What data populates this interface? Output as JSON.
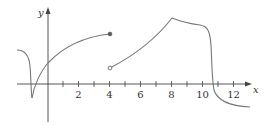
{
  "graph": {
    "x_axis_label": "x",
    "y_axis_label": "y",
    "x_tick_labels": [
      {
        "value": 2,
        "label": "2"
      },
      {
        "value": 4,
        "label": "4"
      },
      {
        "value": 6,
        "label": "6"
      },
      {
        "value": 8,
        "label": "8"
      },
      {
        "value": 10,
        "label": "10"
      },
      {
        "value": 12,
        "label": "12"
      }
    ],
    "colors": {
      "axis": "#444444",
      "curve": "#777777"
    },
    "features": {
      "filled_point": {
        "x": 4,
        "description": "closed dot at end of left curve"
      },
      "open_point": {
        "x": 4,
        "description": "open circle at start of right curve"
      },
      "corner_at": 8,
      "cusp_at": -1
    }
  }
}
